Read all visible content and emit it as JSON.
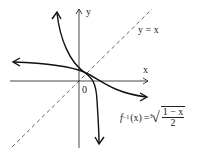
{
  "diagram": {
    "type": "function-and-inverse-graph",
    "axes": {
      "x_label": "x",
      "y_label": "y",
      "origin_label": "0"
    },
    "reference_line": {
      "label": "y = x",
      "style": "dashed"
    },
    "inverse_function": {
      "name": "f",
      "superscript": "−1",
      "argument": "(x)",
      "equals": "=",
      "radical_index": "3",
      "numerator": "1 − x",
      "denominator": "2"
    },
    "colors": {
      "curve": "#111111",
      "axes": "#333333",
      "dashed_line": "#555555"
    }
  }
}
